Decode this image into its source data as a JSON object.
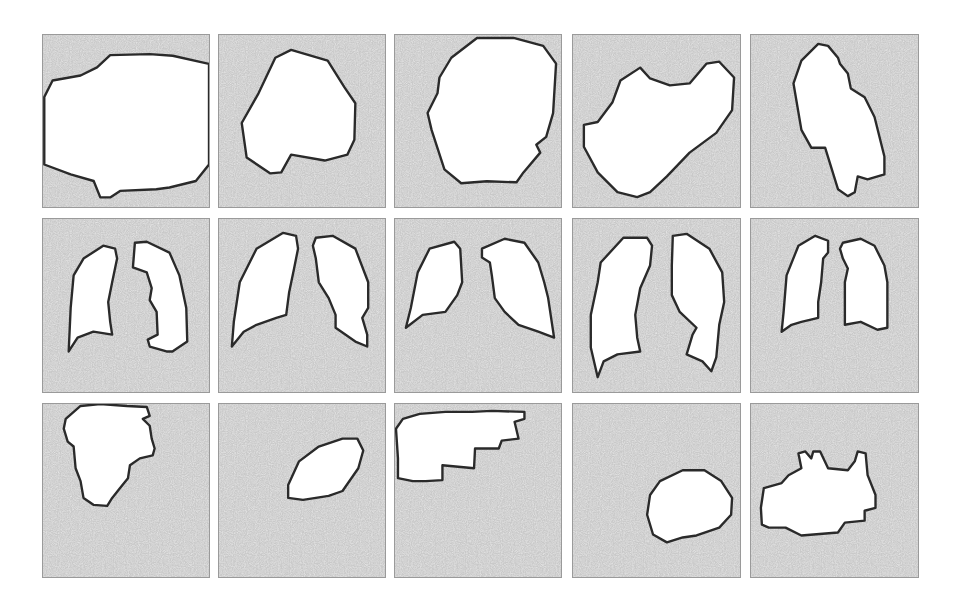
{
  "figure": {
    "rows": 3,
    "columns": 5,
    "colors": {
      "page_background": "#ffffff",
      "tile_background": "#c9c9c9",
      "tile_border": "#9a9a9a",
      "mask_fill": "#ffffff",
      "mask_outline": "#2a2a2a"
    },
    "tiles": [
      {
        "row": 1,
        "col": 1,
        "content": "single large blob mask"
      },
      {
        "row": 1,
        "col": 2,
        "content": "single rounded polygon mask"
      },
      {
        "row": 1,
        "col": 3,
        "content": "single oval mask"
      },
      {
        "row": 1,
        "col": 4,
        "content": "single kidney-like mask"
      },
      {
        "row": 1,
        "col": 5,
        "content": "single elongated tilted mask"
      },
      {
        "row": 2,
        "col": 1,
        "content": "lung pair mask"
      },
      {
        "row": 2,
        "col": 2,
        "content": "lung pair mask"
      },
      {
        "row": 2,
        "col": 3,
        "content": "lung pair mask"
      },
      {
        "row": 2,
        "col": 4,
        "content": "lung pair mask"
      },
      {
        "row": 2,
        "col": 5,
        "content": "lung pair mask"
      },
      {
        "row": 3,
        "col": 1,
        "content": "irregular blob mask top-left"
      },
      {
        "row": 3,
        "col": 2,
        "content": "small oval mask"
      },
      {
        "row": 3,
        "col": 3,
        "content": "stepped irregular mask top"
      },
      {
        "row": 3,
        "col": 4,
        "content": "round mask bottom-right"
      },
      {
        "row": 3,
        "col": 5,
        "content": "irregular jagged mask"
      }
    ]
  }
}
